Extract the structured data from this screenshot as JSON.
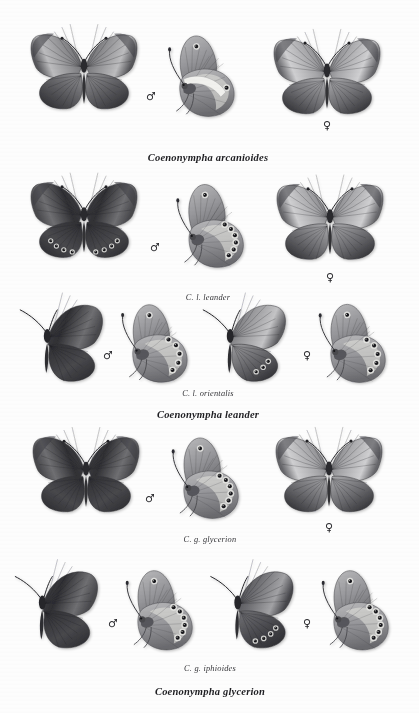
{
  "plate": {
    "kind": "entomological-specimen-plate",
    "genus": "Coenonympha",
    "background_color": "#fdfdfd",
    "ink_color": "#26262a",
    "width": 419,
    "height": 713
  },
  "symbols": {
    "male": "♂",
    "female": "♀"
  },
  "sections": [
    {
      "id": "arcanioides",
      "species_caption": "Coenonympha arcanioides",
      "species_caption_x": 208,
      "species_caption_y": 152,
      "subspecies_caption": "",
      "specimens": [
        {
          "name": "male-dorsal",
          "view": "dorsal",
          "sex": "male",
          "x": 84,
          "y": 75,
          "w": 112,
          "h": 82,
          "tone": "dark-forewing-tip"
        },
        {
          "name": "male-ventral",
          "view": "ventral",
          "sex": "male",
          "x": 202,
          "y": 78,
          "w": 62,
          "h": 84,
          "ocelli": 1,
          "band": true
        },
        {
          "name": "female-dorsal",
          "view": "dorsal",
          "sex": "female",
          "x": 327,
          "y": 80,
          "w": 118,
          "h": 86,
          "tone": "pale-forewing"
        }
      ],
      "sex_marks": [
        {
          "sex": "male",
          "x": 151,
          "y": 96
        },
        {
          "sex": "female",
          "x": 327,
          "y": 125
        }
      ]
    },
    {
      "id": "leander-nominate",
      "species_caption": "",
      "subspecies_caption": "C. l. leander",
      "subspecies_caption_x": 208,
      "subspecies_caption_y": 293,
      "specimens": [
        {
          "name": "male-dorsal",
          "view": "dorsal",
          "sex": "male",
          "x": 84,
          "y": 224,
          "w": 118,
          "h": 92,
          "tone": "dark",
          "ocelli": 4
        },
        {
          "name": "male-ventral",
          "view": "ventral",
          "sex": "male",
          "x": 211,
          "y": 228,
          "w": 66,
          "h": 92,
          "ocelli": 6
        },
        {
          "name": "female-dorsal",
          "view": "dorsal",
          "sex": "female",
          "x": 330,
          "y": 226,
          "w": 122,
          "h": 94,
          "tone": "pale-forewing",
          "ocelli": 0
        }
      ],
      "sex_marks": [
        {
          "sex": "male",
          "x": 155,
          "y": 247
        },
        {
          "sex": "female",
          "x": 330,
          "y": 277
        }
      ]
    },
    {
      "id": "leander-orientalis",
      "species_caption": "Coenonympha leander",
      "species_caption_x": 208,
      "species_caption_y": 409,
      "subspecies_caption": "C. l. orientalis",
      "subspecies_caption_x": 208,
      "subspecies_caption_y": 389,
      "specimens": [
        {
          "name": "male-dorsal",
          "view": "dorsal-folded",
          "sex": "male",
          "x": 66,
          "y": 345,
          "w": 74,
          "h": 68,
          "tone": "dark"
        },
        {
          "name": "male-ventral",
          "view": "ventral",
          "sex": "male",
          "x": 155,
          "y": 345,
          "w": 62,
          "h": 74,
          "ocelli": 5
        },
        {
          "name": "female-dorsal",
          "view": "dorsal-folded",
          "sex": "female",
          "x": 248,
          "y": 345,
          "w": 70,
          "h": 68,
          "tone": "pale",
          "ocelli": 3
        },
        {
          "name": "female-ventral",
          "view": "ventral",
          "sex": "female",
          "x": 353,
          "y": 345,
          "w": 64,
          "h": 76,
          "ocelli": 5
        }
      ],
      "sex_marks": [
        {
          "sex": "male",
          "x": 108,
          "y": 355
        },
        {
          "sex": "female",
          "x": 307,
          "y": 355
        }
      ]
    },
    {
      "id": "glycerion-nominate",
      "species_caption": "",
      "subspecies_caption": "C. g. glycerion",
      "subspecies_caption_x": 210,
      "subspecies_caption_y": 535,
      "specimens": [
        {
          "name": "male-dorsal",
          "view": "dorsal",
          "sex": "male",
          "x": 86,
          "y": 478,
          "w": 112,
          "h": 84,
          "tone": "dark"
        },
        {
          "name": "male-ventral",
          "view": "ventral",
          "sex": "male",
          "x": 206,
          "y": 480,
          "w": 64,
          "h": 84,
          "ocelli": 6
        },
        {
          "name": "female-dorsal",
          "view": "dorsal",
          "sex": "female",
          "x": 329,
          "y": 478,
          "w": 116,
          "h": 86,
          "tone": "pale-forewing"
        }
      ],
      "sex_marks": [
        {
          "sex": "male",
          "x": 150,
          "y": 498
        },
        {
          "sex": "female",
          "x": 329,
          "y": 527
        }
      ]
    },
    {
      "id": "glycerion-iphioides",
      "species_caption": "Coenonympha glycerion",
      "species_caption_x": 210,
      "species_caption_y": 686,
      "subspecies_caption": "C. g. iphioides",
      "subspecies_caption_x": 210,
      "subspecies_caption_y": 664,
      "specimens": [
        {
          "name": "male-dorsal",
          "view": "dorsal-folded",
          "sex": "male",
          "x": 62,
          "y": 612,
          "w": 78,
          "h": 74,
          "tone": "dark"
        },
        {
          "name": "male-ventral",
          "view": "ventral",
          "sex": "male",
          "x": 160,
          "y": 612,
          "w": 64,
          "h": 80,
          "ocelli": 6
        },
        {
          "name": "female-dorsal",
          "view": "dorsal-folded",
          "sex": "female",
          "x": 257,
          "y": 612,
          "w": 76,
          "h": 74,
          "tone": "mid",
          "ocelli": 4
        },
        {
          "name": "female-ventral",
          "view": "ventral",
          "sex": "female",
          "x": 356,
          "y": 612,
          "w": 64,
          "h": 80,
          "ocelli": 6
        }
      ],
      "sex_marks": [
        {
          "sex": "male",
          "x": 113,
          "y": 623
        },
        {
          "sex": "female",
          "x": 307,
          "y": 623
        }
      ]
    }
  ]
}
